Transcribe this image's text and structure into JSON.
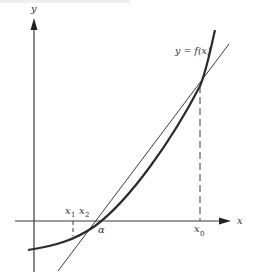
{
  "figure": {
    "type": "secant-method-illustration",
    "curve_label": "y = f(x)",
    "axes": {
      "x_label": "x",
      "y_label": "y"
    },
    "points": {
      "x0": "x",
      "x0_sub": "0",
      "x1": "x",
      "x1_sub": "1",
      "x2": "x",
      "x2_sub": "2",
      "root": "α"
    },
    "colors": {
      "curve": "#2b2b2b",
      "line": "#3a3a3a",
      "axis": "#3a3a3a",
      "background": "#ffffff"
    }
  }
}
